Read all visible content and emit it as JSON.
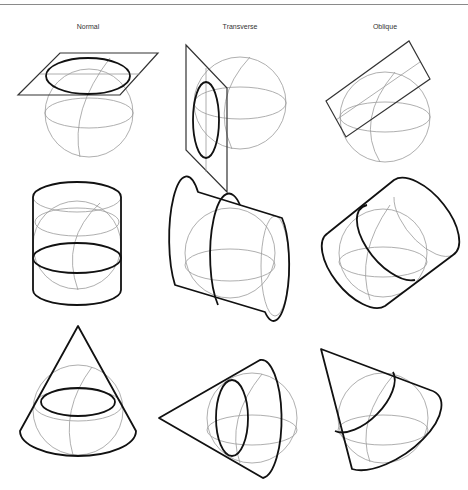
{
  "figure": {
    "columns": [
      {
        "label": "Normal"
      },
      {
        "label": "Transverse"
      },
      {
        "label": "Oblique"
      }
    ],
    "rows": [
      {
        "surface": "plane (azimuthal)"
      },
      {
        "surface": "cylinder"
      },
      {
        "surface": "cone"
      }
    ],
    "colors": {
      "outline": "#111111",
      "graticule": "#9a9a9a",
      "rule": "#8a8a8a"
    }
  }
}
